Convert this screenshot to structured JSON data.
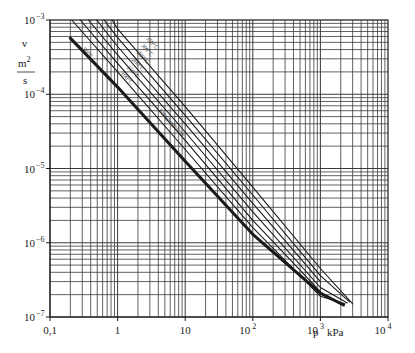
{
  "chart_data": {
    "type": "line",
    "title": "",
    "xlabel": "p  kPa",
    "ylabel": "ν  m²/s",
    "xscale": "log",
    "yscale": "log",
    "xlim": [
      0.1,
      10000
    ],
    "ylim": [
      1e-07,
      0.001
    ],
    "grid": true,
    "x_ticks": [
      {
        "value": 0.1,
        "base": "0,1",
        "exp": ""
      },
      {
        "value": 1,
        "base": "1",
        "exp": ""
      },
      {
        "value": 10,
        "base": "10",
        "exp": ""
      },
      {
        "value": 100,
        "base": "10",
        "exp": "2"
      },
      {
        "value": 1000,
        "base": "10",
        "exp": "3"
      },
      {
        "value": 10000,
        "base": "10",
        "exp": "4"
      }
    ],
    "y_ticks": [
      {
        "value": 0.001,
        "base": "10",
        "exp": "−3"
      },
      {
        "value": 0.0001,
        "base": "10",
        "exp": "−4"
      },
      {
        "value": 1e-05,
        "base": "10",
        "exp": "−5"
      },
      {
        "value": 1e-06,
        "base": "10",
        "exp": "−6"
      },
      {
        "value": 1e-07,
        "base": "10",
        "exp": "−7"
      }
    ],
    "series": [
      {
        "name": "Sättigungslinie",
        "style": "thick",
        "x": [
          0.2,
          1,
          10,
          100,
          1000,
          2200
        ],
        "y": [
          0.00057,
          0.000125,
          1.25e-05,
          1.3e-06,
          2.1e-07,
          1.45e-07
        ]
      },
      {
        "name": "100°C",
        "style": "thin",
        "x": [
          0.21,
          1,
          10,
          100,
          1000,
          2300
        ],
        "y": [
          0.001,
          0.0002,
          1.8e-05,
          1.6e-06,
          1.9e-07,
          1.5e-07
        ]
      },
      {
        "name": "150°C",
        "style": "thin",
        "x": [
          0.28,
          1,
          10,
          100,
          1000
        ],
        "y": [
          0.001,
          0.00026,
          2.4e-05,
          2e-06,
          2.2e-07
        ]
      },
      {
        "name": "200°C",
        "style": "thin",
        "x": [
          0.37,
          1,
          10,
          100,
          1000,
          2500
        ],
        "y": [
          0.001,
          0.00034,
          3.1e-05,
          2.6e-06,
          2.5e-07,
          1.55e-07
        ]
      },
      {
        "name": "250°C",
        "style": "thin",
        "x": [
          0.49,
          1,
          10,
          100,
          1000
        ],
        "y": [
          0.001,
          0.00044,
          4e-05,
          3.4e-06,
          3e-07
        ]
      },
      {
        "name": "300°C",
        "style": "thin",
        "x": [
          0.63,
          1,
          10,
          100,
          1000,
          2700
        ],
        "y": [
          0.001,
          0.00058,
          5.2e-05,
          4.4e-06,
          3.6e-07,
          1.6e-07
        ]
      },
      {
        "name": "350°C",
        "style": "thin",
        "x": [
          0.83,
          1,
          10,
          100,
          1000,
          3000
        ],
        "y": [
          0.001,
          0.00076,
          6.8e-05,
          5.6e-06,
          4.5e-07,
          1.5e-07
        ]
      }
    ],
    "annotations": [
      {
        "text": "Sättigungslinie",
        "x": 4,
        "y": 6e-05,
        "angle": 47
      },
      {
        "text": "50°C",
        "x": 0.3,
        "y": 0.0004,
        "angle": 47
      },
      {
        "text": "100°C",
        "x": 1.1,
        "y": 0.00019,
        "angle": 47
      },
      {
        "text": "150°C",
        "x": 1.35,
        "y": 0.00023,
        "angle": 47
      },
      {
        "text": "200°C",
        "x": 1.6,
        "y": 0.00029,
        "angle": 47
      },
      {
        "text": "250°C",
        "x": 1.9,
        "y": 0.00036,
        "angle": 47
      },
      {
        "text": "300°C",
        "x": 2.2,
        "y": 0.00045,
        "angle": 47
      },
      {
        "text": "350°C",
        "x": 2.6,
        "y": 0.00056,
        "angle": 47
      }
    ]
  },
  "labels": {
    "y_symbol": "ν",
    "y_unit_num": "m",
    "y_unit_exp": "2",
    "y_unit_den": "s",
    "x_symbol": "p",
    "x_unit": "kPa"
  },
  "colors": {
    "line": "#1a1a1a",
    "grid": "#3a3a3a",
    "background": "#ffffff"
  }
}
